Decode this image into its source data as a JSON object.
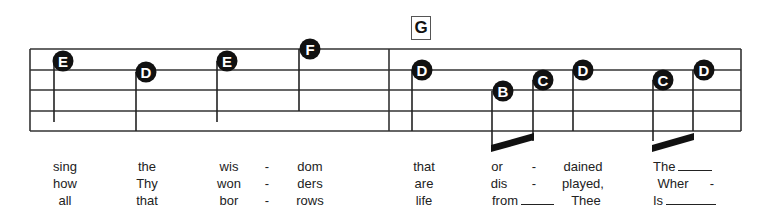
{
  "chord": "G",
  "staff": {
    "left": 30,
    "right": 741,
    "lines_y": [
      49,
      70,
      90,
      111,
      131
    ],
    "barline_x": 389
  },
  "notes": [
    {
      "name": "E",
      "x": 63,
      "y": 61,
      "stem_x": 54,
      "stem_bottom": 122
    },
    {
      "name": "D",
      "x": 146,
      "y": 72,
      "stem_x": 136,
      "stem_bottom": 131
    },
    {
      "name": "E",
      "x": 227,
      "y": 61,
      "stem_x": 217,
      "stem_bottom": 122
    },
    {
      "name": "F",
      "x": 310,
      "y": 49,
      "stem_x": 299,
      "stem_bottom": 111
    },
    {
      "name": "D",
      "x": 422,
      "y": 70,
      "stem_x": 412,
      "stem_bottom": 131
    },
    {
      "name": "B",
      "x": 503,
      "y": 91,
      "stem_x": 492,
      "stem_bottom": 151
    },
    {
      "name": "C",
      "x": 543,
      "y": 80,
      "stem_x": 533,
      "stem_bottom": 141
    },
    {
      "name": "D",
      "x": 583,
      "y": 70,
      "stem_x": 573,
      "stem_bottom": 131
    },
    {
      "name": "C",
      "x": 663,
      "y": 80,
      "stem_x": 653,
      "stem_bottom": 141
    },
    {
      "name": "D",
      "x": 704,
      "y": 70,
      "stem_x": 693,
      "stem_bottom": 131
    }
  ],
  "beams": [
    {
      "x1": 492,
      "x2": 533
    },
    {
      "x1": 653,
      "x2": 693
    }
  ],
  "lyrics": {
    "verse1": [
      "sing",
      "the",
      "wis",
      "-",
      "dom",
      "that",
      "or",
      "-",
      "dained",
      "The"
    ],
    "verse2": [
      "how",
      "Thy",
      "won",
      "-",
      "ders",
      "are",
      "dis",
      "-",
      "played,",
      "Wher",
      "-"
    ],
    "verse3": [
      "all",
      "that",
      "bor",
      "-",
      "rows",
      "life",
      "from",
      "Thee",
      "Is"
    ]
  }
}
